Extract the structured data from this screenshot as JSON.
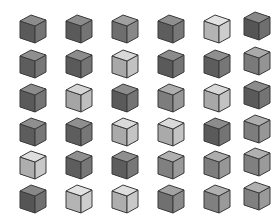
{
  "scene": {
    "title": "Grid of isometric cubes",
    "background_color": "#ffffff",
    "rows": 6,
    "columns": 6,
    "cube_count": 36,
    "cube_size_px": 24,
    "outline_color": "#3a3a3a",
    "description": "A 6 by 6 array of identical 3D cubes drawn in isometric projection, each rendered in a different shade of gray."
  },
  "chart_data": {
    "type": "heatmap",
    "xlabel": "",
    "ylabel": "",
    "categories": [
      "C1",
      "C2",
      "C3",
      "C4",
      "C5",
      "C6"
    ],
    "row_labels": [
      "R1",
      "R2",
      "R3",
      "R4",
      "R5",
      "R6"
    ],
    "grid": false,
    "legend": "none",
    "value_range": [
      0,
      1
    ],
    "values": [
      [
        0.36,
        0.36,
        0.46,
        0.38,
        0.86,
        0.34
      ],
      [
        0.38,
        0.36,
        0.8,
        0.36,
        0.38,
        0.52
      ],
      [
        0.36,
        0.78,
        0.36,
        0.54,
        0.8,
        0.36
      ],
      [
        0.38,
        0.38,
        0.82,
        0.82,
        0.36,
        0.54
      ],
      [
        0.84,
        0.38,
        0.38,
        0.56,
        0.54,
        0.56
      ],
      [
        0.34,
        0.86,
        0.84,
        0.48,
        0.56,
        0.56
      ]
    ]
  },
  "cubes": [
    {
      "id": "cube-r1c1",
      "row": 1,
      "col": 6,
      "x": 16,
      "y": 13,
      "top": "#8c8c8c",
      "left": "#5a5a5a",
      "right": "#747474",
      "shade": "dark"
    },
    {
      "id": "cube-r1c2",
      "row": 1,
      "col": 2,
      "x": 62,
      "y": 13,
      "top": "#8c8c8c",
      "left": "#5a5a5a",
      "right": "#747474",
      "shade": "dark"
    },
    {
      "id": "cube-r1c3",
      "row": 1,
      "col": 3,
      "x": 108,
      "y": 13,
      "top": "#a0a0a0",
      "left": "#6e6e6e",
      "right": "#888888",
      "shade": "medium-dark"
    },
    {
      "id": "cube-r1c4",
      "row": 1,
      "col": 4,
      "x": 154,
      "y": 13,
      "top": "#8f8f8f",
      "left": "#5d5d5d",
      "right": "#777777",
      "shade": "dark"
    },
    {
      "id": "cube-r1c5",
      "row": 1,
      "col": 5,
      "x": 200,
      "y": 13,
      "top": "#e2e2e2",
      "left": "#b4b4b4",
      "right": "#cdcdcd",
      "shade": "very-light"
    },
    {
      "id": "cube-r1c6",
      "row": 1,
      "col": 6,
      "x": 240,
      "y": 10,
      "top": "#888888",
      "left": "#555555",
      "right": "#6f6f6f",
      "shade": "dark"
    },
    {
      "id": "cube-r2c1",
      "row": 2,
      "col": 1,
      "x": 16,
      "y": 48,
      "top": "#8f8f8f",
      "left": "#5d5d5d",
      "right": "#777777",
      "shade": "dark"
    },
    {
      "id": "cube-r2c2",
      "row": 2,
      "col": 2,
      "x": 62,
      "y": 48,
      "top": "#8c8c8c",
      "left": "#5a5a5a",
      "right": "#747474",
      "shade": "dark"
    },
    {
      "id": "cube-r2c3",
      "row": 2,
      "col": 3,
      "x": 108,
      "y": 48,
      "top": "#d8d8d8",
      "left": "#a8a8a8",
      "right": "#c2c2c2",
      "shade": "light"
    },
    {
      "id": "cube-r2c4",
      "row": 2,
      "col": 4,
      "x": 154,
      "y": 48,
      "top": "#8c8c8c",
      "left": "#5a5a5a",
      "right": "#747474",
      "shade": "dark"
    },
    {
      "id": "cube-r2c5",
      "row": 2,
      "col": 5,
      "x": 200,
      "y": 48,
      "top": "#8f8f8f",
      "left": "#5d5d5d",
      "right": "#777777",
      "shade": "dark"
    },
    {
      "id": "cube-r2c6",
      "row": 2,
      "col": 6,
      "x": 240,
      "y": 45,
      "top": "#aaaaaa",
      "left": "#7a7a7a",
      "right": "#949494",
      "shade": "medium"
    },
    {
      "id": "cube-r3c1",
      "row": 3,
      "col": 1,
      "x": 16,
      "y": 82,
      "top": "#8c8c8c",
      "left": "#5a5a5a",
      "right": "#747474",
      "shade": "dark"
    },
    {
      "id": "cube-r3c2",
      "row": 3,
      "col": 2,
      "x": 62,
      "y": 82,
      "top": "#d5d5d5",
      "left": "#a5a5a5",
      "right": "#bfbfbf",
      "shade": "light"
    },
    {
      "id": "cube-r3c3",
      "row": 3,
      "col": 3,
      "x": 108,
      "y": 82,
      "top": "#8c8c8c",
      "left": "#5a5a5a",
      "right": "#747474",
      "shade": "dark"
    },
    {
      "id": "cube-r3c4",
      "row": 3,
      "col": 4,
      "x": 154,
      "y": 82,
      "top": "#adadad",
      "left": "#7d7d7d",
      "right": "#979797",
      "shade": "medium"
    },
    {
      "id": "cube-r3c5",
      "row": 3,
      "col": 5,
      "x": 200,
      "y": 82,
      "top": "#d8d8d8",
      "left": "#a8a8a8",
      "right": "#c2c2c2",
      "shade": "light"
    },
    {
      "id": "cube-r3c6",
      "row": 3,
      "col": 6,
      "x": 240,
      "y": 79,
      "top": "#8c8c8c",
      "left": "#5a5a5a",
      "right": "#747474",
      "shade": "dark"
    },
    {
      "id": "cube-r4c1",
      "row": 4,
      "col": 1,
      "x": 16,
      "y": 116,
      "top": "#8f8f8f",
      "left": "#5d5d5d",
      "right": "#777777",
      "shade": "dark"
    },
    {
      "id": "cube-r4c2",
      "row": 4,
      "col": 2,
      "x": 62,
      "y": 116,
      "top": "#8f8f8f",
      "left": "#5d5d5d",
      "right": "#777777",
      "shade": "dark"
    },
    {
      "id": "cube-r4c3",
      "row": 4,
      "col": 3,
      "x": 108,
      "y": 116,
      "top": "#dadada",
      "left": "#aaaaaa",
      "right": "#c4c4c4",
      "shade": "light"
    },
    {
      "id": "cube-r4c4",
      "row": 4,
      "col": 4,
      "x": 154,
      "y": 116,
      "top": "#dadada",
      "left": "#aaaaaa",
      "right": "#c4c4c4",
      "shade": "light"
    },
    {
      "id": "cube-r4c5",
      "row": 4,
      "col": 5,
      "x": 200,
      "y": 116,
      "top": "#8c8c8c",
      "left": "#5a5a5a",
      "right": "#747474",
      "shade": "dark"
    },
    {
      "id": "cube-r4c6",
      "row": 4,
      "col": 6,
      "x": 240,
      "y": 113,
      "top": "#adadad",
      "left": "#7d7d7d",
      "right": "#979797",
      "shade": "medium"
    },
    {
      "id": "cube-r5c1",
      "row": 5,
      "col": 1,
      "x": 16,
      "y": 149,
      "top": "#dedede",
      "left": "#aeaeae",
      "right": "#c8c8c8",
      "shade": "light"
    },
    {
      "id": "cube-r5c2",
      "row": 5,
      "col": 2,
      "x": 62,
      "y": 149,
      "top": "#8f8f8f",
      "left": "#5d5d5d",
      "right": "#777777",
      "shade": "dark"
    },
    {
      "id": "cube-r5c3",
      "row": 5,
      "col": 3,
      "x": 108,
      "y": 149,
      "top": "#8f8f8f",
      "left": "#5d5d5d",
      "right": "#777777",
      "shade": "dark"
    },
    {
      "id": "cube-r5c4",
      "row": 5,
      "col": 4,
      "x": 154,
      "y": 149,
      "top": "#b0b0b0",
      "left": "#808080",
      "right": "#9a9a9a",
      "shade": "medium"
    },
    {
      "id": "cube-r5c5",
      "row": 5,
      "col": 5,
      "x": 200,
      "y": 149,
      "top": "#adadad",
      "left": "#7d7d7d",
      "right": "#979797",
      "shade": "medium"
    },
    {
      "id": "cube-r5c6",
      "row": 5,
      "col": 6,
      "x": 240,
      "y": 146,
      "top": "#b0b0b0",
      "left": "#808080",
      "right": "#9a9a9a",
      "shade": "medium"
    },
    {
      "id": "cube-r6c1",
      "row": 6,
      "col": 1,
      "x": 16,
      "y": 183,
      "top": "#888888",
      "left": "#555555",
      "right": "#6f6f6f",
      "shade": "dark"
    },
    {
      "id": "cube-r6c2",
      "row": 6,
      "col": 2,
      "x": 62,
      "y": 183,
      "top": "#e2e2e2",
      "left": "#b4b4b4",
      "right": "#cdcdcd",
      "shade": "very-light"
    },
    {
      "id": "cube-r6c3",
      "row": 6,
      "col": 3,
      "x": 108,
      "y": 183,
      "top": "#dedede",
      "left": "#aeaeae",
      "right": "#c8c8c8",
      "shade": "light"
    },
    {
      "id": "cube-r6c4",
      "row": 6,
      "col": 4,
      "x": 154,
      "y": 183,
      "top": "#a2a2a2",
      "left": "#707070",
      "right": "#8a8a8a",
      "shade": "medium-dark"
    },
    {
      "id": "cube-r6c5",
      "row": 6,
      "col": 5,
      "x": 200,
      "y": 183,
      "top": "#b0b0b0",
      "left": "#808080",
      "right": "#9a9a9a",
      "shade": "medium"
    },
    {
      "id": "cube-r6c6",
      "row": 6,
      "col": 6,
      "x": 240,
      "y": 180,
      "top": "#b0b0b0",
      "left": "#808080",
      "right": "#9a9a9a",
      "shade": "medium"
    }
  ]
}
